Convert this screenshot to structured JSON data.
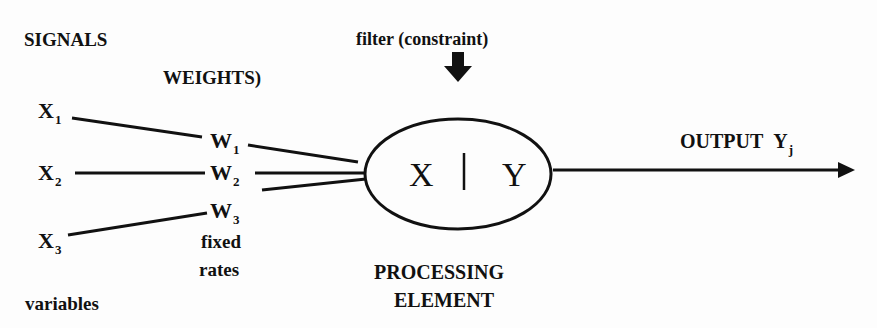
{
  "diagram": {
    "title_signals": "SIGNALS",
    "title_weights": "WEIGHTS)",
    "filter_label": "filter (constraint)",
    "inputs": [
      {
        "name": "X",
        "sub": "1"
      },
      {
        "name": "X",
        "sub": "2"
      },
      {
        "name": "X",
        "sub": "3"
      }
    ],
    "weights": [
      {
        "name": "W",
        "sub": "1"
      },
      {
        "name": "W",
        "sub": "2"
      },
      {
        "name": "W",
        "sub": "3"
      }
    ],
    "weights_note_line1": "fixed",
    "weights_note_line2": "rates",
    "inputs_note": "variables",
    "processing_element": {
      "left_symbol": "X",
      "right_symbol": "Y",
      "label_line1": "PROCESSING",
      "label_line2": "ELEMENT"
    },
    "output": {
      "label": "OUTPUT",
      "symbol": "Y",
      "sub": "j"
    },
    "icons": {
      "filter_arrow": "down-arrow-icon",
      "output_arrow": "right-arrow-icon"
    }
  }
}
